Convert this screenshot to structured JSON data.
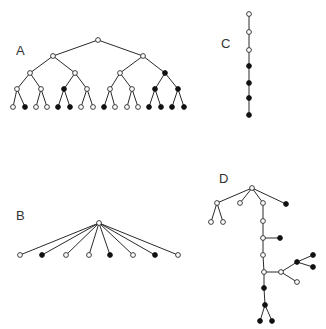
{
  "colors": {
    "background": "#ffffff",
    "edge": "#2a2a2a",
    "filled": "#111111",
    "open": "#ffffff"
  },
  "node_radius": 2.4,
  "trees": [
    {
      "id": "A",
      "label": "A",
      "label_pos": [
        16,
        55
      ],
      "nodes": [
        {
          "id": "a0",
          "x": 98,
          "y": 40,
          "filled": false
        },
        {
          "id": "a1",
          "x": 53,
          "y": 56,
          "filled": false
        },
        {
          "id": "a2",
          "x": 143,
          "y": 56,
          "filled": false
        },
        {
          "id": "a3",
          "x": 30,
          "y": 73,
          "filled": false
        },
        {
          "id": "a4",
          "x": 75,
          "y": 73,
          "filled": false
        },
        {
          "id": "a5",
          "x": 120,
          "y": 73,
          "filled": false
        },
        {
          "id": "a6",
          "x": 165,
          "y": 73,
          "filled": true
        },
        {
          "id": "a7",
          "x": 17,
          "y": 89,
          "filled": false
        },
        {
          "id": "a8",
          "x": 41,
          "y": 89,
          "filled": false
        },
        {
          "id": "a9",
          "x": 64,
          "y": 89,
          "filled": true
        },
        {
          "id": "a10",
          "x": 87,
          "y": 89,
          "filled": false
        },
        {
          "id": "a11",
          "x": 110,
          "y": 89,
          "filled": false
        },
        {
          "id": "a12",
          "x": 132,
          "y": 89,
          "filled": false
        },
        {
          "id": "a13",
          "x": 155,
          "y": 89,
          "filled": true
        },
        {
          "id": "a14",
          "x": 178,
          "y": 89,
          "filled": true
        },
        {
          "id": "a15",
          "x": 13,
          "y": 107,
          "filled": false
        },
        {
          "id": "a16",
          "x": 25,
          "y": 107,
          "filled": true
        },
        {
          "id": "a17",
          "x": 36,
          "y": 107,
          "filled": false
        },
        {
          "id": "a18",
          "x": 47,
          "y": 107,
          "filled": false
        },
        {
          "id": "a19",
          "x": 58,
          "y": 107,
          "filled": true
        },
        {
          "id": "a20",
          "x": 70,
          "y": 107,
          "filled": true
        },
        {
          "id": "a21",
          "x": 81,
          "y": 107,
          "filled": false
        },
        {
          "id": "a22",
          "x": 93,
          "y": 107,
          "filled": false
        },
        {
          "id": "a23",
          "x": 104,
          "y": 107,
          "filled": true
        },
        {
          "id": "a24",
          "x": 115,
          "y": 107,
          "filled": false
        },
        {
          "id": "a25",
          "x": 127,
          "y": 107,
          "filled": false
        },
        {
          "id": "a26",
          "x": 138,
          "y": 107,
          "filled": false
        },
        {
          "id": "a27",
          "x": 149,
          "y": 107,
          "filled": true
        },
        {
          "id": "a28",
          "x": 161,
          "y": 107,
          "filled": true
        },
        {
          "id": "a29",
          "x": 172,
          "y": 107,
          "filled": true
        },
        {
          "id": "a30",
          "x": 184,
          "y": 107,
          "filled": true
        }
      ],
      "edges": [
        [
          "a0",
          "a1"
        ],
        [
          "a0",
          "a2"
        ],
        [
          "a1",
          "a3"
        ],
        [
          "a1",
          "a4"
        ],
        [
          "a2",
          "a5"
        ],
        [
          "a2",
          "a6"
        ],
        [
          "a3",
          "a7"
        ],
        [
          "a3",
          "a8"
        ],
        [
          "a4",
          "a9"
        ],
        [
          "a4",
          "a10"
        ],
        [
          "a5",
          "a11"
        ],
        [
          "a5",
          "a12"
        ],
        [
          "a6",
          "a13"
        ],
        [
          "a6",
          "a14"
        ],
        [
          "a7",
          "a15"
        ],
        [
          "a7",
          "a16"
        ],
        [
          "a8",
          "a17"
        ],
        [
          "a8",
          "a18"
        ],
        [
          "a9",
          "a19"
        ],
        [
          "a9",
          "a20"
        ],
        [
          "a10",
          "a21"
        ],
        [
          "a10",
          "a22"
        ],
        [
          "a11",
          "a23"
        ],
        [
          "a11",
          "a24"
        ],
        [
          "a12",
          "a25"
        ],
        [
          "a12",
          "a26"
        ],
        [
          "a13",
          "a27"
        ],
        [
          "a13",
          "a28"
        ],
        [
          "a14",
          "a29"
        ],
        [
          "a14",
          "a30"
        ]
      ]
    },
    {
      "id": "B",
      "label": "B",
      "label_pos": [
        16,
        220
      ],
      "nodes": [
        {
          "id": "b0",
          "x": 99,
          "y": 223,
          "filled": false
        },
        {
          "id": "b1",
          "x": 20,
          "y": 255,
          "filled": false
        },
        {
          "id": "b2",
          "x": 42,
          "y": 255,
          "filled": true
        },
        {
          "id": "b3",
          "x": 66,
          "y": 255,
          "filled": false
        },
        {
          "id": "b4",
          "x": 89,
          "y": 255,
          "filled": false
        },
        {
          "id": "b5",
          "x": 110,
          "y": 255,
          "filled": true
        },
        {
          "id": "b6",
          "x": 133,
          "y": 255,
          "filled": false
        },
        {
          "id": "b7",
          "x": 155,
          "y": 255,
          "filled": true
        },
        {
          "id": "b8",
          "x": 178,
          "y": 255,
          "filled": false
        }
      ],
      "edges": [
        [
          "b0",
          "b1"
        ],
        [
          "b0",
          "b2"
        ],
        [
          "b0",
          "b3"
        ],
        [
          "b0",
          "b4"
        ],
        [
          "b0",
          "b5"
        ],
        [
          "b0",
          "b6"
        ],
        [
          "b0",
          "b7"
        ],
        [
          "b0",
          "b8"
        ]
      ]
    },
    {
      "id": "C",
      "label": "C",
      "label_pos": [
        221,
        48
      ],
      "nodes": [
        {
          "id": "c0",
          "x": 249,
          "y": 14,
          "filled": false
        },
        {
          "id": "c1",
          "x": 249,
          "y": 32,
          "filled": false
        },
        {
          "id": "c2",
          "x": 249,
          "y": 50,
          "filled": false
        },
        {
          "id": "c3",
          "x": 249,
          "y": 66,
          "filled": true
        },
        {
          "id": "c4",
          "x": 249,
          "y": 83,
          "filled": true
        },
        {
          "id": "c5",
          "x": 249,
          "y": 98,
          "filled": true
        },
        {
          "id": "c6",
          "x": 249,
          "y": 115,
          "filled": true
        }
      ],
      "edges": [
        [
          "c0",
          "c1"
        ],
        [
          "c1",
          "c2"
        ],
        [
          "c2",
          "c3"
        ],
        [
          "c3",
          "c4"
        ],
        [
          "c4",
          "c5"
        ],
        [
          "c5",
          "c6"
        ]
      ]
    },
    {
      "id": "D",
      "label": "D",
      "label_pos": [
        219,
        183
      ],
      "nodes": [
        {
          "id": "d0",
          "x": 252,
          "y": 188,
          "filled": false
        },
        {
          "id": "d1",
          "x": 217,
          "y": 203,
          "filled": false
        },
        {
          "id": "d2",
          "x": 240,
          "y": 203,
          "filled": false
        },
        {
          "id": "d3",
          "x": 263,
          "y": 203,
          "filled": false
        },
        {
          "id": "d4",
          "x": 286,
          "y": 204,
          "filled": true
        },
        {
          "id": "d5",
          "x": 211,
          "y": 222,
          "filled": false
        },
        {
          "id": "d6",
          "x": 223,
          "y": 222,
          "filled": false
        },
        {
          "id": "d7",
          "x": 263,
          "y": 221,
          "filled": false
        },
        {
          "id": "d8",
          "x": 263,
          "y": 238,
          "filled": false
        },
        {
          "id": "d9",
          "x": 280,
          "y": 238,
          "filled": true
        },
        {
          "id": "d10",
          "x": 263,
          "y": 255,
          "filled": false
        },
        {
          "id": "d11",
          "x": 264,
          "y": 272,
          "filled": false
        },
        {
          "id": "d12",
          "x": 281,
          "y": 272,
          "filled": false
        },
        {
          "id": "d13",
          "x": 297,
          "y": 262,
          "filled": true
        },
        {
          "id": "d14",
          "x": 313,
          "y": 255,
          "filled": true
        },
        {
          "id": "d15",
          "x": 313,
          "y": 267,
          "filled": true
        },
        {
          "id": "d16",
          "x": 297,
          "y": 282,
          "filled": false
        },
        {
          "id": "d17",
          "x": 264,
          "y": 288,
          "filled": true
        },
        {
          "id": "d18",
          "x": 265,
          "y": 305,
          "filled": true
        },
        {
          "id": "d19",
          "x": 260,
          "y": 321,
          "filled": true
        },
        {
          "id": "d20",
          "x": 272,
          "y": 321,
          "filled": true
        }
      ],
      "edges": [
        [
          "d0",
          "d1"
        ],
        [
          "d0",
          "d2"
        ],
        [
          "d0",
          "d3"
        ],
        [
          "d0",
          "d4"
        ],
        [
          "d1",
          "d5"
        ],
        [
          "d1",
          "d6"
        ],
        [
          "d3",
          "d7"
        ],
        [
          "d7",
          "d8"
        ],
        [
          "d8",
          "d9"
        ],
        [
          "d8",
          "d10"
        ],
        [
          "d10",
          "d11"
        ],
        [
          "d11",
          "d12"
        ],
        [
          "d12",
          "d13"
        ],
        [
          "d13",
          "d14"
        ],
        [
          "d13",
          "d15"
        ],
        [
          "d12",
          "d16"
        ],
        [
          "d11",
          "d17"
        ],
        [
          "d17",
          "d18"
        ],
        [
          "d18",
          "d19"
        ],
        [
          "d18",
          "d20"
        ]
      ]
    }
  ]
}
